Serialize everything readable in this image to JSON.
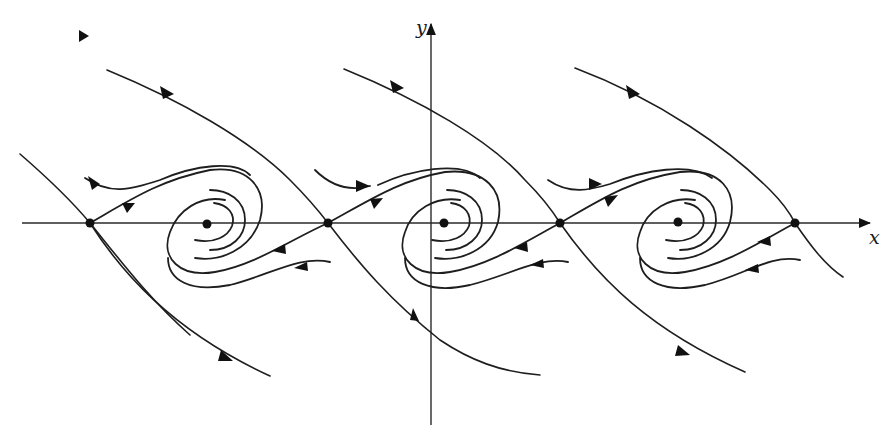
{
  "figure": {
    "axes": {
      "x_label": "x",
      "y_label": "y"
    },
    "colors": {
      "background": "#ffffff",
      "ink": "#1e1e1e"
    },
    "fixed_points": {
      "saddles": [
        {
          "x": 90,
          "y": 223
        },
        {
          "x": 328,
          "y": 223
        },
        {
          "x": 560,
          "y": 223
        },
        {
          "x": 795,
          "y": 223
        }
      ],
      "stable_spirals": [
        {
          "x": 207,
          "y": 223
        },
        {
          "x": 444,
          "y": 223
        },
        {
          "x": 678,
          "y": 223
        }
      ]
    }
  }
}
